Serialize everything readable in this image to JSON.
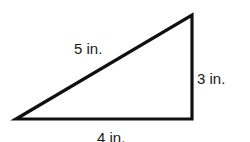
{
  "diagram": {
    "shape": "right-triangle",
    "stroke_color": "#111111",
    "background": "#ffffff",
    "vertices": {
      "bottom_left": [
        16,
        119
      ],
      "bottom_right": [
        192,
        119
      ],
      "top_right": [
        192,
        15
      ]
    },
    "labels": {
      "hypotenuse": "5 in.",
      "vertical_leg": "3 in.",
      "horizontal_leg": "4 in."
    }
  }
}
